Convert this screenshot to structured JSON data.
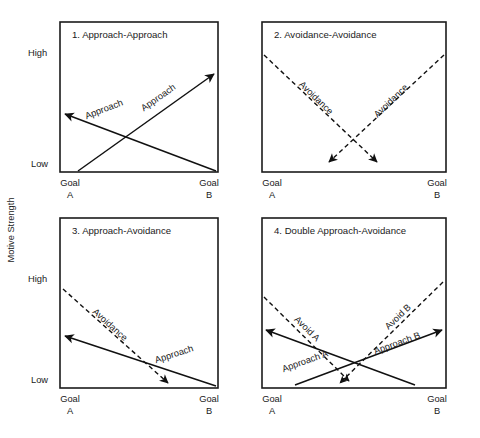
{
  "figure": {
    "axis_title_y": "Motive Strength",
    "scale_labels": {
      "high": "High",
      "low": "Low"
    },
    "goal_labels": {
      "a_top": "Goal",
      "a_bottom": "A",
      "b_top": "Goal",
      "b_bottom": "B"
    },
    "caption": ""
  },
  "panels": [
    {
      "id": "panel-1",
      "title": "1. Approach-Approach",
      "curves": [
        {
          "name": "approach-from-a",
          "label": "Approach",
          "style": "solid",
          "direction": "up-right"
        },
        {
          "name": "approach-from-b",
          "label": "Approach",
          "style": "solid",
          "direction": "up-left"
        }
      ]
    },
    {
      "id": "panel-2",
      "title": "2. Avoidance-Avoidance",
      "curves": [
        {
          "name": "avoidance-from-a",
          "label": "Avoidance",
          "style": "dashed",
          "direction": "down-right"
        },
        {
          "name": "avoidance-from-b",
          "label": "Avoidance",
          "style": "dashed",
          "direction": "down-left"
        }
      ]
    },
    {
      "id": "panel-3",
      "title": "3. Approach-Avoidance",
      "curves": [
        {
          "name": "avoidance-curve",
          "label": "Avoidance",
          "style": "dashed",
          "direction": "down-right"
        },
        {
          "name": "approach-curve",
          "label": "Approach",
          "style": "solid",
          "direction": "up-left"
        }
      ]
    },
    {
      "id": "panel-4",
      "title": "4. Double Approach-Avoidance",
      "curves": [
        {
          "name": "avoid-a-curve",
          "label": "Avoid A",
          "style": "dashed",
          "direction": "down-right"
        },
        {
          "name": "avoid-b-curve",
          "label": "Avoid B",
          "style": "dashed",
          "direction": "down-left"
        },
        {
          "name": "approach-a-curve",
          "label": "Approach A",
          "style": "solid",
          "direction": "up-left"
        },
        {
          "name": "approach-b-curve",
          "label": "Approach B",
          "style": "solid",
          "direction": "up-right"
        }
      ]
    }
  ]
}
